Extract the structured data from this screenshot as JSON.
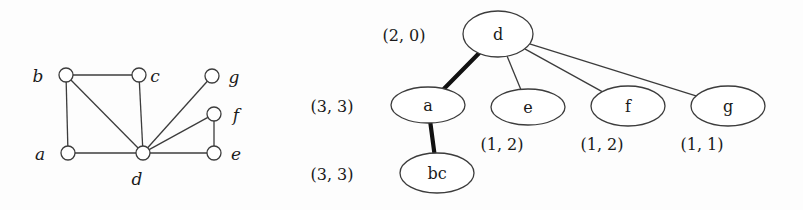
{
  "figure": {
    "title": "",
    "background_color": "#fdfdfd",
    "ink_color": "#3c3c3c",
    "thick_edge_color": "#111111"
  },
  "graph": {
    "name": "input-graph",
    "vertices": [
      {
        "id": "b",
        "label": "b",
        "cx": 66,
        "cy": 75,
        "r": 7,
        "label_x": 38,
        "label_y": 82
      },
      {
        "id": "c",
        "label": "c",
        "cx": 139,
        "cy": 75,
        "r": 7,
        "label_x": 155,
        "label_y": 82
      },
      {
        "id": "g",
        "label": "g",
        "cx": 212,
        "cy": 76,
        "r": 7,
        "label_x": 234,
        "label_y": 83
      },
      {
        "id": "f",
        "label": "f",
        "cx": 214,
        "cy": 114,
        "r": 7,
        "label_x": 236,
        "label_y": 121
      },
      {
        "id": "a",
        "label": "a",
        "cx": 68,
        "cy": 153,
        "r": 7,
        "label_x": 40,
        "label_y": 160
      },
      {
        "id": "d",
        "label": "d",
        "cx": 143,
        "cy": 153,
        "r": 7,
        "label_x": 137,
        "label_y": 185
      },
      {
        "id": "e",
        "label": "e",
        "cx": 214,
        "cy": 153,
        "r": 7,
        "label_x": 236,
        "label_y": 160
      }
    ],
    "edges": [
      {
        "from": "b",
        "to": "c"
      },
      {
        "from": "b",
        "to": "a"
      },
      {
        "from": "b",
        "to": "d"
      },
      {
        "from": "c",
        "to": "d"
      },
      {
        "from": "a",
        "to": "d"
      },
      {
        "from": "d",
        "to": "e"
      },
      {
        "from": "d",
        "to": "f"
      },
      {
        "from": "d",
        "to": "g"
      },
      {
        "from": "f",
        "to": "e"
      }
    ]
  },
  "tree": {
    "name": "tree-decomposition",
    "nodes": [
      {
        "id": "d",
        "label": "d",
        "cx": 498,
        "cy": 34,
        "rx": 35,
        "ry": 23,
        "pair": "(2, 0)",
        "pair_x": 404,
        "pair_y": 41
      },
      {
        "id": "a",
        "label": "a",
        "cx": 428,
        "cy": 105,
        "rx": 37,
        "ry": 18,
        "pair": "(3, 3)",
        "pair_x": 332,
        "pair_y": 112
      },
      {
        "id": "e",
        "label": "e",
        "cx": 528,
        "cy": 107,
        "rx": 37,
        "ry": 18,
        "pair": "(1, 2)",
        "pair_x": 502,
        "pair_y": 150
      },
      {
        "id": "f",
        "label": "f",
        "cx": 628,
        "cy": 106,
        "rx": 37,
        "ry": 20,
        "pair": "(1, 2)",
        "pair_x": 602,
        "pair_y": 150
      },
      {
        "id": "g",
        "label": "g",
        "cx": 728,
        "cy": 106,
        "rx": 37,
        "ry": 20,
        "pair": "(1, 1)",
        "pair_x": 702,
        "pair_y": 150
      },
      {
        "id": "bc",
        "label": "bc",
        "cx": 437,
        "cy": 173,
        "rx": 37,
        "ry": 20,
        "pair": "(3, 3)",
        "pair_x": 332,
        "pair_y": 180
      }
    ],
    "edges": [
      {
        "from": "d",
        "to": "a",
        "weight": "thick"
      },
      {
        "from": "d",
        "to": "e",
        "weight": "thin"
      },
      {
        "from": "d",
        "to": "f",
        "weight": "thin"
      },
      {
        "from": "d",
        "to": "g",
        "weight": "thin"
      },
      {
        "from": "a",
        "to": "bc",
        "weight": "thick"
      }
    ]
  }
}
